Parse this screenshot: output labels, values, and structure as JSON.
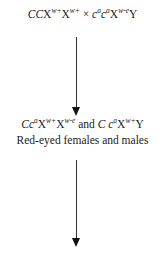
{
  "cross": {
    "parent1": {
      "a1": "C",
      "a2": "C",
      "x1": "X",
      "x1_sup": "w+",
      "x2": "X",
      "x2_sup": "w+"
    },
    "operator": "×",
    "parent2": {
      "a1": "c",
      "a1_sup": "a",
      "a2": "c",
      "a2_sup": "a",
      "x1": "X",
      "x1_sup": "w-e",
      "y": "Y"
    }
  },
  "offspring": {
    "female": {
      "a1": "C",
      "a2": "c",
      "a2_sup": "a",
      "x1": "X",
      "x1_sup": "w+",
      "x2": "X",
      "x2_sup": "w-e"
    },
    "conj": "and",
    "male": {
      "a1": "C",
      "a2": "c",
      "a2_sup": "a",
      "x1": "X",
      "x1_sup": "w+",
      "y": "Y"
    },
    "phenotype": "Red-eyed females and males"
  }
}
